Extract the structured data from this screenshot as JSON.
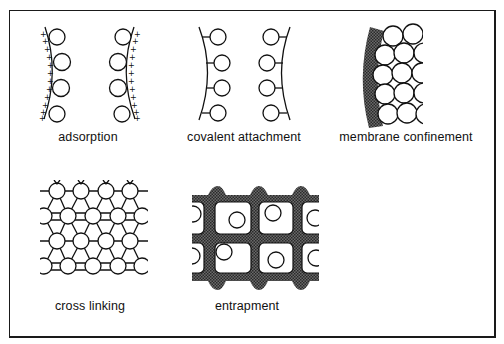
{
  "figure": {
    "panels": [
      {
        "id": "adsorption",
        "label": "adsorption"
      },
      {
        "id": "covalent",
        "label": "covalent  attachment"
      },
      {
        "id": "membrane",
        "label": "membrane  confinement"
      },
      {
        "id": "crosslinking",
        "label": "cross  linking"
      },
      {
        "id": "entrapment",
        "label": "entrapment"
      }
    ],
    "colors": {
      "stroke": "#111111",
      "hatch": "#555555",
      "background": "#ffffff"
    }
  }
}
